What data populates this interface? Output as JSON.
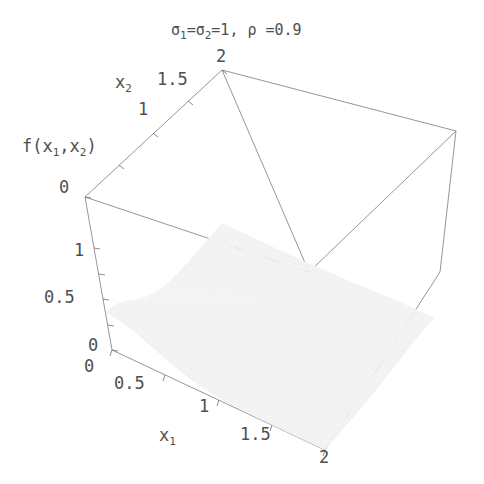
{
  "figure": {
    "title_parts": {
      "sigma1": "σ",
      "sigma1_sub": "1",
      "eq1": "=",
      "sigma2": "σ",
      "sigma2_sub": "2",
      "eq2": "=1, ",
      "rho": "ρ",
      "eq3": " =0.9"
    },
    "background_color": "#ffffff",
    "line_color": "#6f6f6f",
    "mesh_color": "#1d1d1d",
    "surface_fill": "#f2f2f2"
  },
  "axes": {
    "x1": {
      "label": "x",
      "label_sub": "1",
      "ticks": [
        "0",
        "0.5",
        "1",
        "1.5",
        "2"
      ],
      "range": [
        0,
        2
      ]
    },
    "x2": {
      "label": "x",
      "label_sub": "2",
      "ticks": [
        "0",
        "1",
        "1.5",
        "2"
      ],
      "range": [
        0,
        2
      ]
    },
    "z": {
      "label": "f(x",
      "label_sub1": "1",
      "label_mid": ",x",
      "label_sub2": "2",
      "label_end": ")",
      "ticks": [
        "0",
        "0.5",
        "1",
        "0"
      ],
      "range": [
        0,
        1.5
      ]
    }
  },
  "tick_labels": {
    "z_top": "0",
    "z_one": "1",
    "z_half": "0.5",
    "z_zero": "0",
    "x1_zero": "0",
    "x1_half": "0.5",
    "x1_one": "1",
    "x1_onehalf": "1.5",
    "x1_two": "2",
    "x2_one": "1",
    "x2_onehalf": "1.5",
    "x2_two": "2"
  },
  "chart_data": {
    "type": "surface",
    "xlabel": "x₁",
    "ylabel": "x₂",
    "zlabel": "f(x₁,x₂)",
    "xlim": [
      0,
      2
    ],
    "ylim": [
      0,
      2
    ],
    "zlim": [
      0,
      1.5
    ],
    "grid": false,
    "legend": "none",
    "function": "bivariate normal density, mu1=mu2=0, sigma1=sigma2=1, rho=0.9",
    "parameters": {
      "sigma1": 1,
      "sigma2": 1,
      "rho": 0.9,
      "mu1": 0,
      "mu2": 0
    },
    "mesh_resolution": [
      40,
      40
    ],
    "xticks": [
      0,
      0.5,
      1,
      1.5,
      2
    ],
    "yticks": [
      0,
      1,
      1.5,
      2
    ],
    "zticks": [
      0,
      0.5,
      1
    ],
    "peak_value": 0.365,
    "peak_at": [
      0,
      0
    ]
  }
}
